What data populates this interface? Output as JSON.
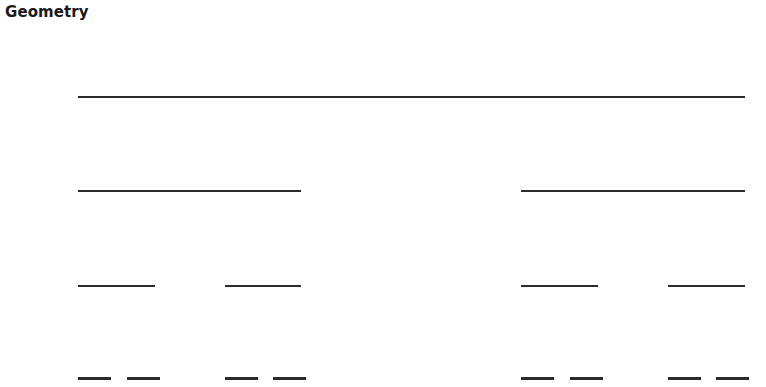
{
  "title": "Geometry",
  "canvas": {
    "width": 766,
    "height": 387,
    "background_color": "#ffffff",
    "line_color": "#2b2b2b"
  },
  "chart_data": {
    "type": "line",
    "title": "Geometry",
    "xlabel": "",
    "ylabel": "",
    "grid": false,
    "legend": null,
    "axis_units": "pixels",
    "xlim": [
      0,
      766
    ],
    "ylim": [
      0,
      387
    ],
    "rows": [
      {
        "level": 1,
        "y": 96,
        "segment_count": 1,
        "segment_length": 667,
        "segments": [
          {
            "x_start": 78,
            "x_end": 745
          }
        ]
      },
      {
        "level": 2,
        "y": 190,
        "segment_count": 2,
        "segment_length": 223,
        "segments": [
          {
            "x_start": 78,
            "x_end": 301
          },
          {
            "x_start": 521,
            "x_end": 745
          }
        ]
      },
      {
        "level": 3,
        "y": 285,
        "segment_count": 4,
        "segment_length": 77,
        "segments": [
          {
            "x_start": 78,
            "x_end": 155
          },
          {
            "x_start": 225,
            "x_end": 301
          },
          {
            "x_start": 521,
            "x_end": 598
          },
          {
            "x_start": 668,
            "x_end": 745
          }
        ]
      },
      {
        "level": 4,
        "y": 377,
        "segment_count": 8,
        "segment_length": 33,
        "segments": [
          {
            "x_start": 78,
            "x_end": 111
          },
          {
            "x_start": 127,
            "x_end": 160
          },
          {
            "x_start": 225,
            "x_end": 258
          },
          {
            "x_start": 273,
            "x_end": 306
          },
          {
            "x_start": 521,
            "x_end": 554
          },
          {
            "x_start": 570,
            "x_end": 603
          },
          {
            "x_start": 668,
            "x_end": 701
          },
          {
            "x_start": 716,
            "x_end": 749
          }
        ]
      }
    ]
  }
}
